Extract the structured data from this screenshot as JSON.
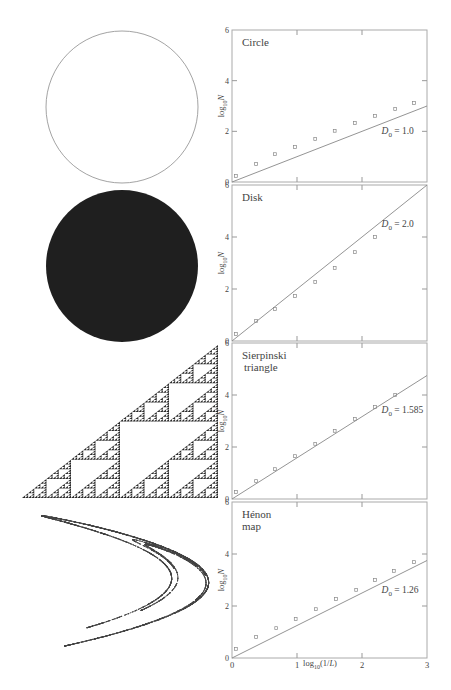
{
  "figure": {
    "xlabel": "log10(1/L)",
    "ylabel": "log10 N",
    "x_ticks": [
      "0",
      "1",
      "2",
      "3"
    ],
    "y_ticks": [
      "0",
      "2",
      "4",
      "6"
    ]
  },
  "shapes": [
    {
      "name": "circle",
      "kind": "outline-circle"
    },
    {
      "name": "disk",
      "kind": "filled-disk"
    },
    {
      "name": "sierpinski-triangle",
      "kind": "fractal-triangle"
    },
    {
      "name": "henon-map",
      "kind": "strange-attractor"
    }
  ],
  "chart_data": [
    {
      "type": "scatter",
      "title": "Circle",
      "xlabel": "log10(1/L)",
      "ylabel": "log10 N",
      "xlim": [
        0,
        3
      ],
      "ylim": [
        0,
        6
      ],
      "series": [
        {
          "name": "box counts",
          "x": [
            0.06,
            0.37,
            0.66,
            0.97,
            1.28,
            1.58,
            1.89,
            2.2,
            2.51,
            2.8
          ],
          "y": [
            0.24,
            0.71,
            1.1,
            1.38,
            1.7,
            2.02,
            2.33,
            2.61,
            2.88,
            3.12
          ]
        },
        {
          "name": "fit line",
          "x": [
            0,
            3
          ],
          "y": [
            0,
            3.0
          ]
        }
      ],
      "annotation": {
        "label": "D",
        "sub": "0",
        "value": " = 1.0",
        "x": 2.3,
        "y": 1.9
      }
    },
    {
      "type": "scatter",
      "title": "Disk",
      "xlabel": "log10(1/L)",
      "ylabel": "log10 N",
      "xlim": [
        0,
        3
      ],
      "ylim": [
        0,
        6
      ],
      "series": [
        {
          "name": "box counts",
          "x": [
            0.06,
            0.37,
            0.66,
            0.97,
            1.28,
            1.58,
            1.89,
            2.2
          ],
          "y": [
            0.27,
            0.77,
            1.23,
            1.73,
            2.27,
            2.81,
            3.42,
            4.0
          ]
        },
        {
          "name": "fit line",
          "x": [
            0,
            3
          ],
          "y": [
            0,
            6.0
          ]
        }
      ],
      "annotation": {
        "label": "D",
        "sub": "0",
        "value": " = 2.0",
        "x": 2.3,
        "y": 4.4
      }
    },
    {
      "type": "scatter",
      "title": "Sierpinski triangle",
      "title_lines": [
        "Sierpinski",
        "triangle"
      ],
      "xlabel": "log10(1/L)",
      "ylabel": "log10 N",
      "xlim": [
        0,
        3
      ],
      "ylim": [
        0,
        6
      ],
      "series": [
        {
          "name": "box counts",
          "x": [
            0.06,
            0.37,
            0.66,
            0.97,
            1.28,
            1.58,
            1.89,
            2.2,
            2.51
          ],
          "y": [
            0.27,
            0.69,
            1.15,
            1.65,
            2.12,
            2.62,
            3.08,
            3.54,
            4.0
          ]
        },
        {
          "name": "fit line",
          "x": [
            0,
            3
          ],
          "y": [
            0,
            4.75
          ]
        }
      ],
      "annotation": {
        "label": "D",
        "sub": "0",
        "value": " = 1.585",
        "x": 2.3,
        "y": 3.3
      }
    },
    {
      "type": "scatter",
      "title": "Hénon map",
      "title_lines": [
        "Hénon",
        "map"
      ],
      "xlabel": "log10(1/L)",
      "ylabel": "log10 N",
      "xlim": [
        0,
        3
      ],
      "ylim": [
        0,
        6
      ],
      "series": [
        {
          "name": "box counts",
          "x": [
            0.06,
            0.37,
            0.68,
            0.98,
            1.29,
            1.6,
            1.91,
            2.2,
            2.49,
            2.8
          ],
          "y": [
            0.35,
            0.81,
            1.15,
            1.5,
            1.88,
            2.27,
            2.62,
            3.0,
            3.35,
            3.69
          ]
        },
        {
          "name": "fit line",
          "x": [
            0,
            3
          ],
          "y": [
            0,
            3.75
          ]
        }
      ],
      "annotation": {
        "label": "D",
        "sub": "0",
        "value": " = 1.26",
        "x": 2.3,
        "y": 2.5
      }
    }
  ]
}
